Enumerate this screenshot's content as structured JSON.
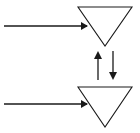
{
  "canvas": {
    "width": 140,
    "height": 133,
    "background_color": "#ffffff"
  },
  "style": {
    "stroke_color": "#1a1a1a",
    "fill_color": "none",
    "stroke_width": 1.1,
    "arrow_stroke_width": 1.3
  },
  "diagram": {
    "type": "flow-diagram",
    "shapes": [
      {
        "id": "triangle-top",
        "name": "top-inverted-triangle",
        "kind": "inverted-triangle",
        "points": "78,7 132,7 105,46",
        "left_x": 78,
        "right_x": 132,
        "top_y": 7,
        "apex_x": 105,
        "apex_y": 46
      },
      {
        "id": "triangle-bottom",
        "name": "bottom-inverted-triangle",
        "kind": "inverted-triangle",
        "points": "78,87 132,87 105,127",
        "left_x": 78,
        "right_x": 132,
        "top_y": 87,
        "apex_x": 105,
        "apex_y": 127
      }
    ],
    "arrows": [
      {
        "id": "arrow-in-top",
        "name": "top-input-arrow",
        "direction": "right",
        "x1": 4,
        "y1": 26,
        "x2": 87,
        "y2": 26,
        "head": "81,22 88,26 81,30"
      },
      {
        "id": "arrow-in-bottom",
        "name": "bottom-input-arrow",
        "direction": "right",
        "x1": 4,
        "y1": 104,
        "x2": 87,
        "y2": 104,
        "head": "81,100 88,104 81,108"
      },
      {
        "id": "arrow-up-middle",
        "name": "middle-up-arrow",
        "direction": "up",
        "x1": 98,
        "y1": 80,
        "x2": 98,
        "y2": 53,
        "head": "94,59 98,51 102,59"
      },
      {
        "id": "arrow-down-middle",
        "name": "middle-down-arrow",
        "direction": "down",
        "x1": 113,
        "y1": 51,
        "x2": 113,
        "y2": 73,
        "head": "109,72 117,72 113,80"
      }
    ]
  }
}
